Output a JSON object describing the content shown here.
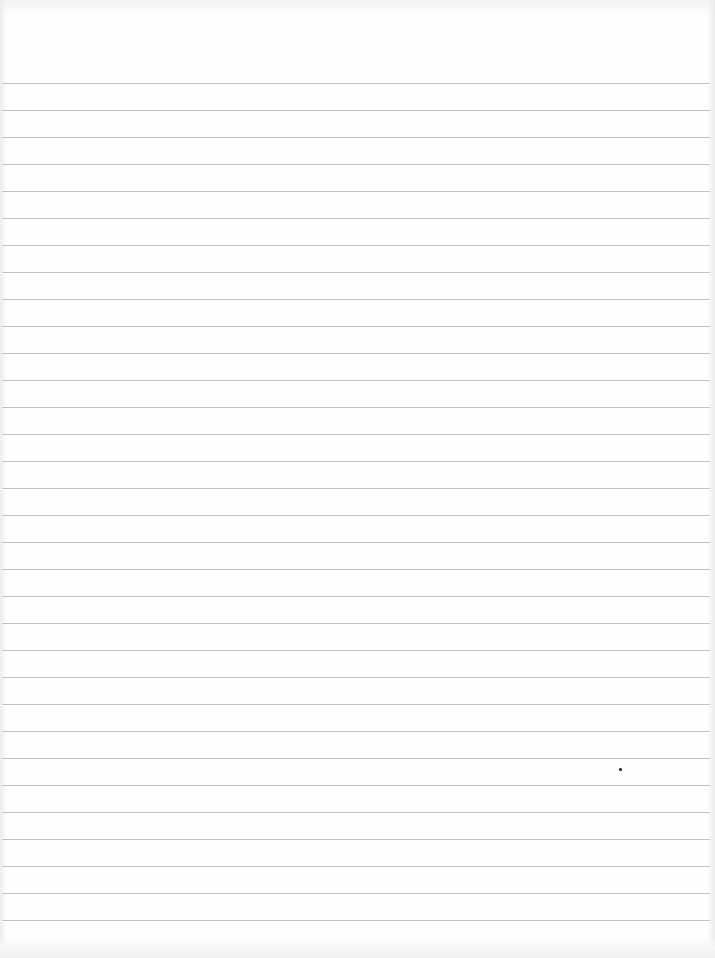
{
  "document": {
    "type": "blank ruled paper",
    "width": 715,
    "height": 958,
    "background_color": "#fefefe",
    "rules": {
      "count": 32,
      "first_y": 83,
      "spacing": 27,
      "color": "#c2c2c2",
      "thickness": 1
    },
    "marks": [
      {
        "kind": "speck",
        "x": 619,
        "y": 768,
        "color": "#1a1a1a"
      }
    ],
    "text": []
  }
}
